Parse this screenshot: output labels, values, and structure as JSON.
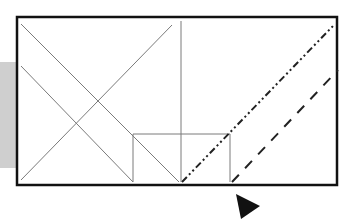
{
  "diagram": {
    "colors": {
      "background": "#ffffff",
      "border": "#111111",
      "thin_line": "#7a7a7a",
      "pattern_line": "#222222",
      "side_strip": "#cfcfcf",
      "pointer": "#111111"
    },
    "frame": {
      "x": 17,
      "y": 17,
      "width": 320,
      "height": 168
    },
    "side_strip": {
      "x": 0,
      "y": 62,
      "width": 17,
      "height": 106
    },
    "solid_lines": [
      {
        "name": "diagonal-a",
        "x1": 21,
        "y1": 24,
        "x2": 179,
        "y2": 182
      },
      {
        "name": "diagonal-b",
        "x1": 21,
        "y1": 66,
        "x2": 133,
        "y2": 182
      },
      {
        "name": "diagonal-c",
        "x1": 21,
        "y1": 180,
        "x2": 172,
        "y2": 25
      },
      {
        "name": "vertical-divider",
        "x1": 181,
        "y1": 21,
        "x2": 181,
        "y2": 182
      }
    ],
    "inner_box": {
      "x": 133,
      "y": 134,
      "width": 97,
      "height": 48
    },
    "dash_dot_line": {
      "x1": 182,
      "y1": 182,
      "x2": 333,
      "y2": 26
    },
    "dashed_line": {
      "x1": 232,
      "y1": 182,
      "x2": 338,
      "y2": 70
    },
    "pointer": {
      "points": "236,194 260,206 241,219"
    }
  }
}
